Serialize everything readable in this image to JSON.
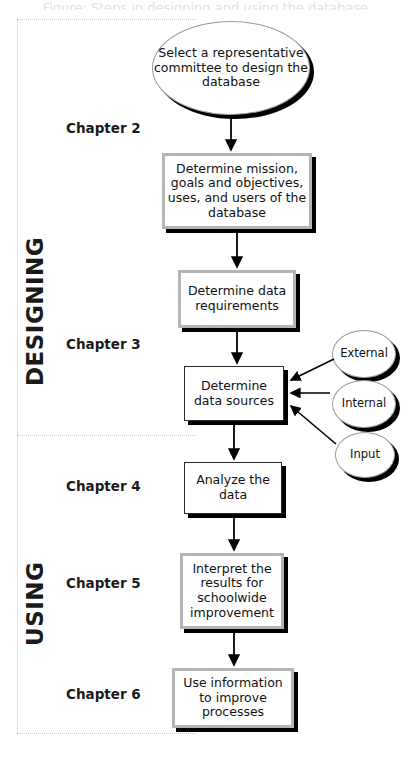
{
  "figure": {
    "top_cropped_text": "Figure: Steps in designing and using the database",
    "sections": [
      {
        "id": "designing",
        "label": "DESIGNING"
      },
      {
        "id": "using",
        "label": "USING"
      }
    ],
    "chapters": [
      {
        "id": "ch2",
        "label": "Chapter 2"
      },
      {
        "id": "ch3",
        "label": "Chapter 3"
      },
      {
        "id": "ch4",
        "label": "Chapter 4"
      },
      {
        "id": "ch5",
        "label": "Chapter 5"
      },
      {
        "id": "ch6",
        "label": "Chapter 6"
      }
    ],
    "start_node": {
      "id": "start",
      "shape": "ellipse",
      "text": "Select a representative committee to design the database"
    },
    "process_nodes": [
      {
        "id": "mission",
        "shape": "rect",
        "border": "gray",
        "text": "Determine mission, goals and objectives, uses, and users of the database"
      },
      {
        "id": "requirements",
        "shape": "rect",
        "border": "gray",
        "text": "Determine data requirements"
      },
      {
        "id": "sources",
        "shape": "rect",
        "border": "thin",
        "text": "Determine data sources"
      },
      {
        "id": "analyze",
        "shape": "rect",
        "border": "thin",
        "text": "Analyze the data"
      },
      {
        "id": "interpret",
        "shape": "rect",
        "border": "gray",
        "text": "Interpret the results for schoolwide improvement"
      },
      {
        "id": "use",
        "shape": "rect",
        "border": "gray",
        "text": "Use information to improve processes"
      }
    ],
    "source_nodes": [
      {
        "id": "external",
        "shape": "ellipse",
        "text": "External"
      },
      {
        "id": "internal",
        "shape": "ellipse",
        "text": "Internal"
      },
      {
        "id": "input",
        "shape": "ellipse",
        "text": "Input"
      }
    ],
    "colors": {
      "stroke": "#000000",
      "box_border_gray": "#b4b4b4",
      "box_border_thin": "#2b2b2b",
      "ellipse_border": "#999999",
      "shadow": "#000000",
      "frame_dotted": "#c9c9c9",
      "background": "#ffffff",
      "text": "#111111"
    }
  }
}
